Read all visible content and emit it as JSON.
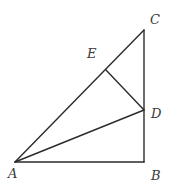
{
  "diagram": {
    "type": "geometry",
    "points": {
      "A": {
        "label": "A",
        "x": 15,
        "y": 162
      },
      "B": {
        "label": "B",
        "x": 144,
        "y": 162
      },
      "C": {
        "label": "C",
        "x": 144,
        "y": 30
      },
      "D": {
        "label": "D",
        "x": 144,
        "y": 110
      },
      "E": {
        "label": "E",
        "x": 106,
        "y": 70
      }
    },
    "labels": {
      "A": "A",
      "B": "B",
      "C": "C",
      "D": "D",
      "E": "E"
    },
    "segments": [
      [
        "A",
        "B"
      ],
      [
        "B",
        "C"
      ],
      [
        "A",
        "C"
      ],
      [
        "A",
        "D"
      ],
      [
        "D",
        "E"
      ]
    ]
  }
}
